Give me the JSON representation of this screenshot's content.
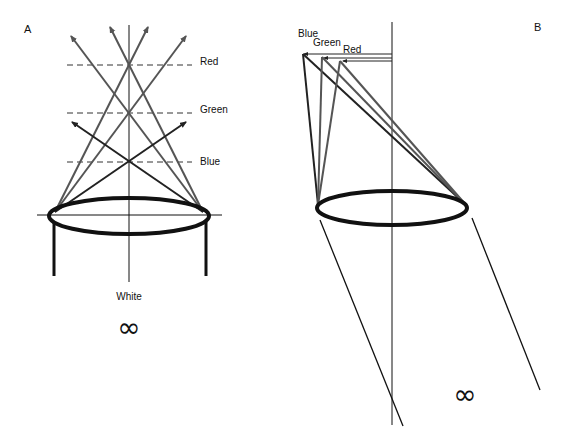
{
  "panel_a": {
    "label": "A",
    "focal_labels": [
      "Red",
      "Green",
      "Blue"
    ],
    "bottom_label": "White",
    "infinity_symbol": "∞"
  },
  "panel_b": {
    "label": "B",
    "focal_labels": [
      "Blue",
      "Green",
      "Red"
    ],
    "infinity_symbol": "∞"
  },
  "colors": {
    "ink": "#111111",
    "gray_ray": "#555555",
    "dark_ray": "#222222"
  }
}
